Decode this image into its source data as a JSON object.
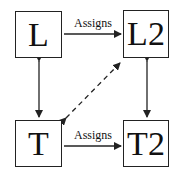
{
  "diagram": {
    "nodes": [
      {
        "id": "L",
        "label": "L"
      },
      {
        "id": "L2",
        "label": "L2"
      },
      {
        "id": "T",
        "label": "T"
      },
      {
        "id": "T2",
        "label": "T2"
      }
    ],
    "edges": [
      {
        "from": "L",
        "to": "L2",
        "label": "Assigns",
        "style": "solid",
        "direction": "forward"
      },
      {
        "from": "T",
        "to": "T2",
        "label": "Assigns",
        "style": "solid",
        "direction": "forward"
      },
      {
        "from": "L",
        "to": "T",
        "label": "",
        "style": "solid",
        "direction": "both"
      },
      {
        "from": "L2",
        "to": "T2",
        "label": "",
        "style": "solid",
        "direction": "both"
      },
      {
        "from": "T",
        "to": "L2",
        "label": "",
        "style": "dashed",
        "direction": "both"
      }
    ],
    "colors": {
      "stroke": "#222222",
      "background": "#ffffff"
    }
  }
}
